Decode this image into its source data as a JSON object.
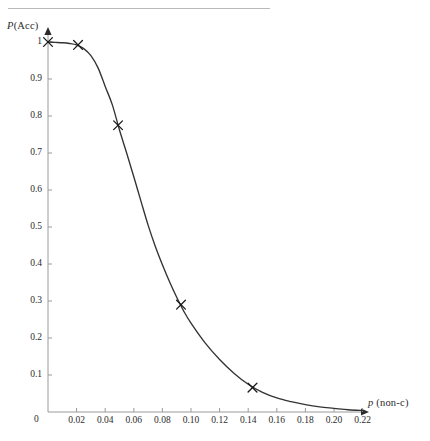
{
  "figure": {
    "top_rule": true,
    "background_color": "#ffffff",
    "curve_color": "#333333",
    "axis_color": "#9a9a9a",
    "marker_color": "#1a1a1a"
  },
  "chart_data": {
    "type": "line",
    "title": "",
    "subtitle": "",
    "xlabel": "p (non-c)",
    "ylabel": "P(Acc)",
    "xlabel_parts": {
      "italic": "p",
      "rest": " (non-c)"
    },
    "ylabel_parts": {
      "italic": "P",
      "rest": "(Acc)"
    },
    "xlim": [
      0,
      0.235
    ],
    "ylim": [
      0,
      1.02
    ],
    "grid": false,
    "legend": null,
    "legend_position": "none",
    "xticks": [
      0.02,
      0.04,
      0.06,
      0.08,
      0.1,
      0.12,
      0.14,
      0.16,
      0.18,
      0.2,
      0.22
    ],
    "xtick_labels": [
      "0.02",
      "0.04",
      "0.06",
      "0.08",
      "0.10",
      "0.12",
      "0.14",
      "0.16",
      "0.18",
      "0.20",
      "0.22"
    ],
    "yticks": [
      0.1,
      0.2,
      0.3,
      0.4,
      0.5,
      0.6,
      0.7,
      0.8,
      0.9,
      1.0
    ],
    "ytick_labels": [
      "0.1",
      "0.2",
      "0.3",
      "0.4",
      "0.5",
      "0.6",
      "0.7",
      "0.8",
      "0.9",
      "1"
    ],
    "origin_label": "0",
    "series": [
      {
        "name": "P(Acc)",
        "marker": "x",
        "x": [
          0.0,
          0.005,
          0.01,
          0.015,
          0.02,
          0.025,
          0.03,
          0.035,
          0.04,
          0.045,
          0.05,
          0.055,
          0.06,
          0.065,
          0.07,
          0.075,
          0.08,
          0.085,
          0.09,
          0.095,
          0.1,
          0.11,
          0.12,
          0.13,
          0.14,
          0.15,
          0.16,
          0.17,
          0.18,
          0.19,
          0.2,
          0.21,
          0.22
        ],
        "y": [
          1.0,
          0.999,
          0.998,
          0.996,
          0.992,
          0.982,
          0.963,
          0.93,
          0.88,
          0.83,
          0.762,
          0.7,
          0.636,
          0.57,
          0.505,
          0.448,
          0.398,
          0.352,
          0.31,
          0.272,
          0.24,
          0.186,
          0.142,
          0.105,
          0.075,
          0.053,
          0.038,
          0.028,
          0.02,
          0.014,
          0.01,
          0.006,
          0.004
        ],
        "markers": [
          {
            "x": 0.0,
            "y": 1.0
          },
          {
            "x": 0.021,
            "y": 0.992
          },
          {
            "x": 0.049,
            "y": 0.775
          },
          {
            "x": 0.093,
            "y": 0.29
          },
          {
            "x": 0.143,
            "y": 0.066
          }
        ]
      }
    ]
  }
}
